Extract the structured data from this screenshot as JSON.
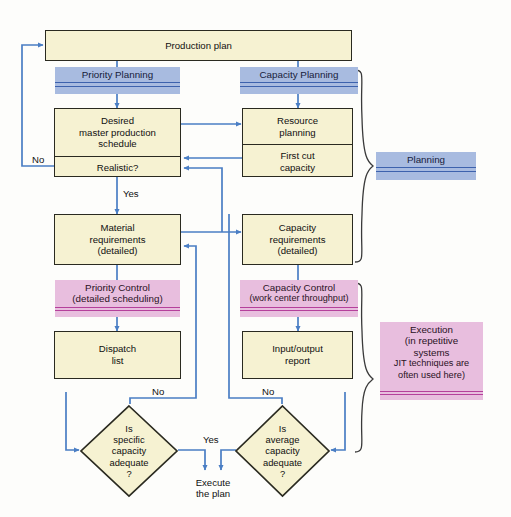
{
  "diagram": {
    "colors": {
      "process_fill": "#f6f2d2",
      "process_border": "#2a2a20",
      "planning_bar_fill": "#a8bbe0",
      "planning_bar_rule": "#3d62ad",
      "execution_bar_fill": "#e8bede",
      "execution_bar_rule": "#b5409b",
      "connector": "#4a7ec4",
      "background": "#fdfdfb"
    },
    "nodes": {
      "production_plan": "Production plan",
      "priority_planning": "Priority Planning",
      "capacity_planning": "Capacity Planning",
      "desired_mps_line1": "Desired",
      "desired_mps_line2": "master production",
      "desired_mps_line3": "schedule",
      "realistic": "Realistic?",
      "resource_planning_line1": "Resource",
      "resource_planning_line2": "planning",
      "first_cut_line1": "First cut",
      "first_cut_line2": "capacity",
      "material_req_line1": "Material",
      "material_req_line2": "requirements",
      "material_req_line3": "(detailed)",
      "capacity_req_line1": "Capacity",
      "capacity_req_line2": "requirements",
      "capacity_req_line3": "(detailed)",
      "priority_control_line1": "Priority Control",
      "priority_control_line2": "(detailed scheduling)",
      "capacity_control_line1": "Capacity Control",
      "capacity_control_line2": "(work center throughput)",
      "dispatch_list_line1": "Dispatch",
      "dispatch_list_line2": "list",
      "input_output_line1": "Input/output",
      "input_output_line2": "report",
      "specific_capacity_line1": "Is",
      "specific_capacity_line2": "specific",
      "specific_capacity_line3": "capacity",
      "specific_capacity_line4": "adequate",
      "specific_capacity_line5": "?",
      "average_capacity_line1": "Is",
      "average_capacity_line2": "average",
      "average_capacity_line3": "capacity",
      "average_capacity_line4": "adequate",
      "average_capacity_line5": "?",
      "planning_legend": "Planning",
      "execution_legend_line1": "Execution",
      "execution_legend_line2": "(in repetitive",
      "execution_legend_line3": "systems",
      "execution_legend_line4": "JIT techniques are",
      "execution_legend_line5": "often used here)"
    },
    "edge_labels": {
      "no_mps": "No",
      "yes_mps": "Yes",
      "no_dispatch": "No",
      "no_input_output": "No",
      "yes_execute": "Yes",
      "execute_line1": "Execute",
      "execute_line2": "the plan"
    }
  }
}
